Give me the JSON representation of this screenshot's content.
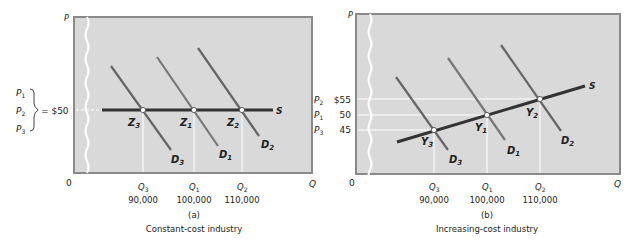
{
  "colors": {
    "panel_bg": "#d9d9d9",
    "panel_border": "#8a8a8a",
    "supply": "#333333",
    "demand": "#6e6e6e",
    "guide": "#ffffff"
  },
  "panel_a": {
    "axis_p": "P",
    "axis_q": "Q",
    "origin": "0",
    "price_labels": [
      "P",
      "P",
      "P"
    ],
    "price_subs": [
      "1",
      "2",
      "3"
    ],
    "price_value": "= $50",
    "supply_label": "S",
    "points": [
      {
        "name": "Z",
        "sub": "3"
      },
      {
        "name": "Z",
        "sub": "1"
      },
      {
        "name": "Z",
        "sub": "2"
      }
    ],
    "demand_labels": [
      {
        "name": "D",
        "sub": "3"
      },
      {
        "name": "D",
        "sub": "1"
      },
      {
        "name": "D",
        "sub": "2"
      }
    ],
    "q_labels": [
      {
        "name": "Q",
        "sub": "3",
        "value": "90,000"
      },
      {
        "name": "Q",
        "sub": "1",
        "value": "100,000"
      },
      {
        "name": "Q",
        "sub": "2",
        "value": "110,000"
      }
    ],
    "caption_letter": "(a)",
    "caption": "Constant-cost industry"
  },
  "panel_b": {
    "axis_p": "P",
    "axis_q": "Q",
    "origin": "0",
    "price_rows": [
      {
        "name": "P",
        "sub": "2",
        "value": "$55"
      },
      {
        "name": "P",
        "sub": "1",
        "value": "50"
      },
      {
        "name": "P",
        "sub": "3",
        "value": "45"
      }
    ],
    "supply_label": "S",
    "points": [
      {
        "name": "Y",
        "sub": "3"
      },
      {
        "name": "Y",
        "sub": "1"
      },
      {
        "name": "Y",
        "sub": "2"
      }
    ],
    "demand_labels": [
      {
        "name": "D",
        "sub": "3"
      },
      {
        "name": "D",
        "sub": "1"
      },
      {
        "name": "D",
        "sub": "2"
      }
    ],
    "q_labels": [
      {
        "name": "Q",
        "sub": "3",
        "value": "90,000"
      },
      {
        "name": "Q",
        "sub": "1",
        "value": "100,000"
      },
      {
        "name": "Q",
        "sub": "2",
        "value": "110,000"
      }
    ],
    "caption_letter": "(b)",
    "caption": "Increasing-cost industry"
  }
}
